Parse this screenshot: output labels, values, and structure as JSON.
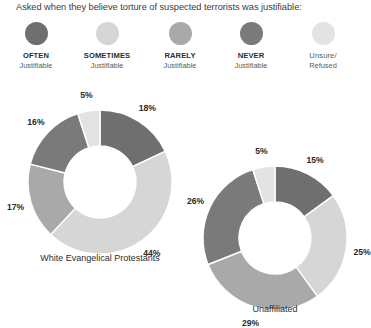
{
  "title": "Asked when they believe torture of suspected terrorists was justifiable:",
  "legend": {
    "items": [
      {
        "title": "OFTEN",
        "sub": "Justifiable",
        "color": "#6f6f6f",
        "bold": true,
        "key": "often"
      },
      {
        "title": "SOMETIMES",
        "sub": "Justifiable",
        "color": "#d6d6d6",
        "bold": true,
        "key": "sometimes"
      },
      {
        "title": "RARELY",
        "sub": "Justifiable",
        "color": "#a9a9a9",
        "bold": true,
        "key": "rarely"
      },
      {
        "title": "NEVER",
        "sub": "Justifiable",
        "color": "#7a7a7a",
        "bold": true,
        "key": "never"
      },
      {
        "title": "Unsure/",
        "sub": "Refused",
        "color": "#e3e3e3",
        "bold": false,
        "key": "unsure"
      }
    ]
  },
  "chart_data": {
    "type": "pie",
    "title": "Asked when they believe torture of suspected terrorists was justifiable:",
    "variant": "donut",
    "legend_position": "top",
    "grid": false,
    "categories": [
      "OFTEN Justifiable",
      "SOMETIMES Justifiable",
      "RARELY Justifiable",
      "NEVER Justifiable",
      "Unsure/Refused"
    ],
    "colors": [
      "#6f6f6f",
      "#d6d6d6",
      "#a9a9a9",
      "#7a7a7a",
      "#e3e3e3"
    ],
    "charts": [
      {
        "name": "White Evangelical Protestants",
        "caption": "White Evangelical Protestants",
        "values": [
          18,
          44,
          17,
          16,
          5
        ],
        "labels": [
          "18%",
          "44%",
          "17%",
          "16%",
          "5%"
        ]
      },
      {
        "name": "Unaffiliated",
        "caption": "Unaffiliated",
        "values": [
          15,
          25,
          29,
          26,
          5
        ],
        "labels": [
          "15%",
          "25%",
          "29%",
          "26%",
          "5%"
        ]
      }
    ]
  },
  "charts": {
    "left": {
      "caption": "White Evangelical Protestants",
      "slices": [
        {
          "label": "18%",
          "value": 18,
          "color": "#6f6f6f"
        },
        {
          "label": "44%",
          "value": 44,
          "color": "#d6d6d6"
        },
        {
          "label": "17%",
          "value": 17,
          "color": "#a9a9a9"
        },
        {
          "label": "16%",
          "value": 16,
          "color": "#7a7a7a"
        },
        {
          "label": "5%",
          "value": 5,
          "color": "#e3e3e3"
        }
      ]
    },
    "right": {
      "caption": "Unaffiliated",
      "slices": [
        {
          "label": "15%",
          "value": 15,
          "color": "#6f6f6f"
        },
        {
          "label": "25%",
          "value": 25,
          "color": "#d6d6d6"
        },
        {
          "label": "29%",
          "value": 29,
          "color": "#a9a9a9"
        },
        {
          "label": "26%",
          "value": 26,
          "color": "#7a7a7a"
        },
        {
          "label": "5%",
          "value": 5,
          "color": "#e3e3e3"
        }
      ]
    }
  }
}
